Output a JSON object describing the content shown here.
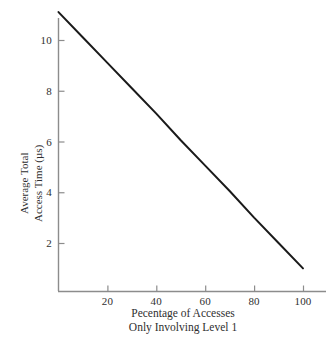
{
  "chart_data": {
    "type": "line",
    "title": "",
    "subtitle": "",
    "xlabel_lines": [
      "Pecentage of Accesses",
      "Only Involving Level 1"
    ],
    "ylabel_lines": [
      "Average Total",
      "Access Time (µs)"
    ],
    "xlabel": "Pecentage of Accesses Only Involving Level 1",
    "ylabel": "Average Total Access Time (µs)",
    "xlim": [
      0,
      104
    ],
    "ylim": [
      -2,
      11.6
    ],
    "xticks": [
      20,
      40,
      60,
      80,
      100
    ],
    "xtick_labels": [
      "20",
      "40",
      "60",
      "80",
      "100"
    ],
    "yticks": [
      2,
      4,
      6,
      8,
      10
    ],
    "ytick_labels": [
      "2",
      "4",
      "6",
      "8",
      "10"
    ],
    "grid": false,
    "legend": false,
    "legend_position": "none",
    "series": [
      {
        "name": "Average total access time",
        "color": "#1a1a1a",
        "line_width": 2,
        "x": [
          0,
          10,
          20,
          30,
          40,
          50,
          60,
          70,
          80,
          90,
          100
        ],
        "values": [
          11.1,
          10.1,
          9.1,
          8.1,
          7.1,
          6.05,
          5.05,
          4.05,
          3.0,
          2.0,
          1.0
        ]
      }
    ],
    "annotations": []
  },
  "axes": {
    "axis_color": "#8c8c8c",
    "tick_color": "#8c8c8c",
    "text_color": "#2f2f2f",
    "background": "#ffffff"
  }
}
